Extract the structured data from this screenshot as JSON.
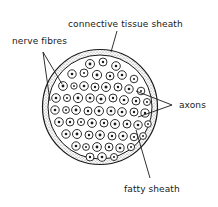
{
  "diagram": {
    "labels": {
      "connective_tissue_sheath": "connective tissue sheath",
      "nerve_fibres": "nerve fibres",
      "axons": "axons",
      "fatty_sheath": "fatty sheath"
    },
    "colors": {
      "ink": "#1a1a1a",
      "background": "#ffffff",
      "stipple": "#8a8a8a"
    }
  }
}
